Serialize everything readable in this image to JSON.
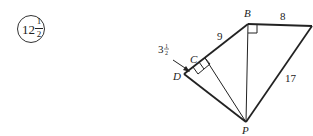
{
  "answer": {
    "whole": "12",
    "numerator": "1",
    "denominator": "2"
  },
  "diagram": {
    "vertices": {
      "B": "B",
      "C": "C",
      "D": "D",
      "P": "P"
    },
    "measurements": {
      "BC": "9",
      "B_right": "8",
      "right_P": "17",
      "CD_whole": "3",
      "CD_num": "1",
      "CD_den": "2"
    },
    "line_color": "#222222"
  }
}
